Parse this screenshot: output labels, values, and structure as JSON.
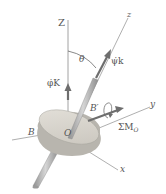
{
  "diagram": {
    "type": "gyroscope-euler-angles",
    "labels": {
      "Z_axis": "Z",
      "z_axis": "z",
      "y_axis": "y",
      "x_axis": "x",
      "theta": "θ",
      "psi_dot_k": "ψ̇k",
      "phi_dot_K": "φ̇K",
      "origin": "O",
      "B": "B",
      "B_prime": "B′",
      "moment": "ΣM",
      "moment_sub": "O"
    },
    "colors": {
      "axis_line": "#8a8a8a",
      "disk_top": "#d9d6cf",
      "disk_side": "#b4b1aa",
      "vector_arrow": "#6e6e6e",
      "shaft": "#a8a8a8",
      "text": "#555555"
    }
  }
}
